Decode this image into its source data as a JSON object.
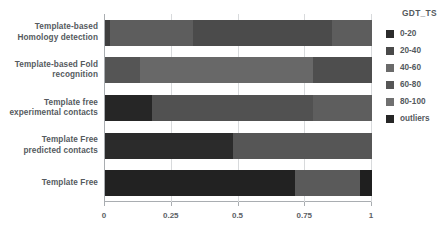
{
  "chart_data": {
    "type": "bar",
    "orientation": "horizontal",
    "stacked": true,
    "normalized": true,
    "title": "",
    "xlabel": "",
    "ylabel": "",
    "xlim": [
      0,
      1
    ],
    "xticks": [
      "0",
      "0.25",
      "0.5",
      "0.75",
      "1"
    ],
    "xtick_values": [
      0,
      0.25,
      0.5,
      0.75,
      1
    ],
    "grid": true,
    "legend_title": "GDT_TS",
    "legend_position": "right",
    "categories": [
      "Template-based\nHomology detection",
      "Template-based Fold\nrecognition",
      "Template free\nexperimental contacts",
      "Template Free\npredicted contacts",
      "Template Free"
    ],
    "category_lines": [
      [
        "Template-based",
        "Homology detection"
      ],
      [
        "Template-based Fold",
        "recognition"
      ],
      [
        "Template free",
        "experimental contacts"
      ],
      [
        "Template Free",
        "predicted contacts"
      ],
      [
        "Template Free"
      ]
    ],
    "series": [
      {
        "name": "0-20",
        "color": "#262626",
        "values": [
          0.0,
          0.0,
          0.175,
          0.48,
          0.71
        ]
      },
      {
        "name": "20-40",
        "color": "#3f3f3f",
        "values": [
          0.018,
          0.0,
          0.0,
          0.0,
          0.0
        ]
      },
      {
        "name": "40-60",
        "color": "#5e5e5e",
        "values": [
          0.0,
          0.13,
          0.0,
          0.52,
          0.0
        ]
      },
      {
        "name": "60-80",
        "color": "#4a4a4a",
        "values": [
          0.312,
          0.0,
          0.605,
          0.0,
          0.0
        ]
      },
      {
        "name": "80-100",
        "color": "#6e6e6e",
        "values": [
          0.52,
          0.65,
          0.22,
          0.0,
          0.245
        ]
      },
      {
        "name": "outliers",
        "color": "#1f1f1f",
        "values": [
          0.15,
          0.22,
          0.0,
          0.0,
          0.045
        ]
      }
    ],
    "bars": [
      {
        "category": "Template-based Homology detection",
        "segments": [
          {
            "series": "20-40",
            "start": 0.0,
            "end": 0.018,
            "value": 0.018,
            "color": "#3f3f3f"
          },
          {
            "series": "60-80",
            "start": 0.018,
            "end": 0.33,
            "value": 0.312,
            "color": "#5d5d5d"
          },
          {
            "series": "80-100",
            "start": 0.33,
            "end": 0.85,
            "value": 0.52,
            "color": "#4b4b4b"
          },
          {
            "series": "outliers",
            "start": 0.85,
            "end": 1.0,
            "value": 0.15,
            "color": "#5d5d5d"
          }
        ]
      },
      {
        "category": "Template-based Fold recognition",
        "segments": [
          {
            "series": "40-60",
            "start": 0.0,
            "end": 0.13,
            "value": 0.13,
            "color": "#555555"
          },
          {
            "series": "80-100",
            "start": 0.13,
            "end": 0.78,
            "value": 0.65,
            "color": "#686868"
          },
          {
            "series": "outliers",
            "start": 0.78,
            "end": 1.0,
            "value": 0.22,
            "color": "#4e4e4e"
          }
        ]
      },
      {
        "category": "Template free experimental contacts",
        "segments": [
          {
            "series": "0-20",
            "start": 0.0,
            "end": 0.175,
            "value": 0.175,
            "color": "#262626"
          },
          {
            "series": "60-80",
            "start": 0.175,
            "end": 0.78,
            "value": 0.605,
            "color": "#515151"
          },
          {
            "series": "80-100",
            "start": 0.78,
            "end": 1.0,
            "value": 0.22,
            "color": "#5e5e5e"
          }
        ]
      },
      {
        "category": "Template Free predicted contacts",
        "segments": [
          {
            "series": "0-20",
            "start": 0.0,
            "end": 0.48,
            "value": 0.48,
            "color": "#2b2b2b"
          },
          {
            "series": "40-60",
            "start": 0.48,
            "end": 1.0,
            "value": 0.52,
            "color": "#565656"
          }
        ]
      },
      {
        "category": "Template Free",
        "segments": [
          {
            "series": "0-20",
            "start": 0.0,
            "end": 0.71,
            "value": 0.71,
            "color": "#222222"
          },
          {
            "series": "80-100",
            "start": 0.71,
            "end": 0.955,
            "value": 0.245,
            "color": "#5a5a5a"
          },
          {
            "series": "outliers",
            "start": 0.955,
            "end": 1.0,
            "value": 0.045,
            "color": "#1f1f1f"
          }
        ]
      }
    ],
    "legend_entries": [
      {
        "label": "0-20",
        "color": "#2b2b2b"
      },
      {
        "label": "20-40",
        "color": "#4a4a4a"
      },
      {
        "label": "40-60",
        "color": "#6a6a6a"
      },
      {
        "label": "60-80",
        "color": "#565656"
      },
      {
        "label": "80-100",
        "color": "#707070"
      },
      {
        "label": "outliers",
        "color": "#262626"
      }
    ]
  },
  "colors": {
    "axis": "#a9adb1",
    "grid": "#d8dadc",
    "text": "#55595d",
    "background": "#ffffff"
  }
}
